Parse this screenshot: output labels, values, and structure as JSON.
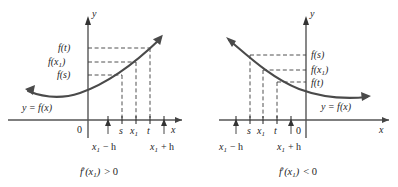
{
  "figure": {
    "name": "derivative-sign-illustration",
    "background_color": "#ffffff",
    "ink_color": "#262626",
    "curve_color": "#4a4a4a",
    "dash_color": "#3c3c3c",
    "panels": [
      {
        "id": "left",
        "caption": "f'(x₁) > 0",
        "caption_parts": {
          "f": "f",
          "prime": "′",
          "open": "(x",
          "sub": "1",
          "close": ")",
          "relation": "> 0"
        },
        "curve_label": "y = f(x)",
        "axis_x_label": "x",
        "axis_y_label": "y",
        "origin_label": "0",
        "slope_sign": "positive",
        "y_labels": [
          {
            "key": "f_t",
            "text": "f(t)",
            "base": "f(t)"
          },
          {
            "key": "f_x1",
            "text": "f(x₁)",
            "base": "f(x",
            "sub": "1",
            "tail": ")"
          },
          {
            "key": "f_s",
            "text": "f(s)",
            "base": "f(s)"
          }
        ],
        "x_ticks": [
          {
            "key": "x1_minus_h",
            "text": "x₁ − h",
            "base": "x",
            "sub": "1",
            "tail": " − h",
            "below": true
          },
          {
            "key": "s",
            "text": "s",
            "base": "s",
            "below": false
          },
          {
            "key": "x1",
            "text": "x₁",
            "base": "x",
            "sub": "1",
            "below": false
          },
          {
            "key": "t",
            "text": "t",
            "base": "t",
            "below": false
          },
          {
            "key": "x1_plus_h",
            "text": "x₁ + h",
            "base": "x",
            "sub": "1",
            "tail": " + h",
            "below": true
          }
        ]
      },
      {
        "id": "right",
        "caption": "f'(x₁) < 0",
        "caption_parts": {
          "f": "f",
          "prime": "′",
          "open": "(x",
          "sub": "1",
          "close": ")",
          "relation": "< 0"
        },
        "curve_label": "y = f(x)",
        "axis_x_label": "x",
        "axis_y_label": "y",
        "origin_label": "0",
        "slope_sign": "negative",
        "y_labels": [
          {
            "key": "f_s",
            "text": "f(s)",
            "base": "f(s)"
          },
          {
            "key": "f_x1",
            "text": "f(x₁)",
            "base": "f(x",
            "sub": "1",
            "tail": ")"
          },
          {
            "key": "f_t",
            "text": "f(t)",
            "base": "f(t)"
          }
        ],
        "x_ticks": [
          {
            "key": "x1_minus_h",
            "text": "x₁ − h",
            "base": "x",
            "sub": "1",
            "tail": " − h",
            "below": true
          },
          {
            "key": "s",
            "text": "s",
            "base": "s",
            "below": false
          },
          {
            "key": "x1",
            "text": "x₁",
            "base": "x",
            "sub": "1",
            "below": false
          },
          {
            "key": "t",
            "text": "t",
            "base": "t",
            "below": false
          },
          {
            "key": "x1_plus_h",
            "text": "x₁ + h",
            "base": "x",
            "sub": "1",
            "tail": " + h",
            "below": true
          }
        ]
      }
    ]
  },
  "left": {
    "caption_f": "f",
    "caption_prime": "′",
    "caption_open": "(x",
    "caption_sub": "1",
    "caption_close": ")",
    "caption_rel": "> 0",
    "curve_label_y": "y",
    "curve_label_eq": "=",
    "curve_label_f": "f",
    "curve_label_arg": "(x)",
    "axis_x": "x",
    "axis_y": "y",
    "zero": "0",
    "lbl_ft_base": "f(t)",
    "lbl_fx1_base": "f(x",
    "lbl_fx1_sub": "1",
    "lbl_fx1_tail": ")",
    "lbl_fs_base": "f(s)",
    "tick_s": "s",
    "tick_x1_base": "x",
    "tick_x1_sub": "1",
    "tick_t": "t",
    "tick_minus_base": "x",
    "tick_minus_sub": "1",
    "tick_minus_tail": "− h",
    "tick_plus_base": "x",
    "tick_plus_sub": "1",
    "tick_plus_tail": "+ h"
  },
  "right": {
    "caption_f": "f",
    "caption_prime": "′",
    "caption_open": "(x",
    "caption_sub": "1",
    "caption_close": ")",
    "caption_rel": "< 0",
    "curve_label_y": "y",
    "curve_label_eq": "=",
    "curve_label_f": "f",
    "curve_label_arg": "(x)",
    "axis_x": "x",
    "axis_y": "y",
    "zero": "0",
    "lbl_fs_base": "f(s)",
    "lbl_fx1_base": "f(x",
    "lbl_fx1_sub": "1",
    "lbl_fx1_tail": ")",
    "lbl_ft_base": "f(t)",
    "tick_s": "s",
    "tick_x1_base": "x",
    "tick_x1_sub": "1",
    "tick_t": "t",
    "tick_minus_base": "x",
    "tick_minus_sub": "1",
    "tick_minus_tail": "− h",
    "tick_plus_base": "x",
    "tick_plus_sub": "1",
    "tick_plus_tail": "+ h"
  }
}
